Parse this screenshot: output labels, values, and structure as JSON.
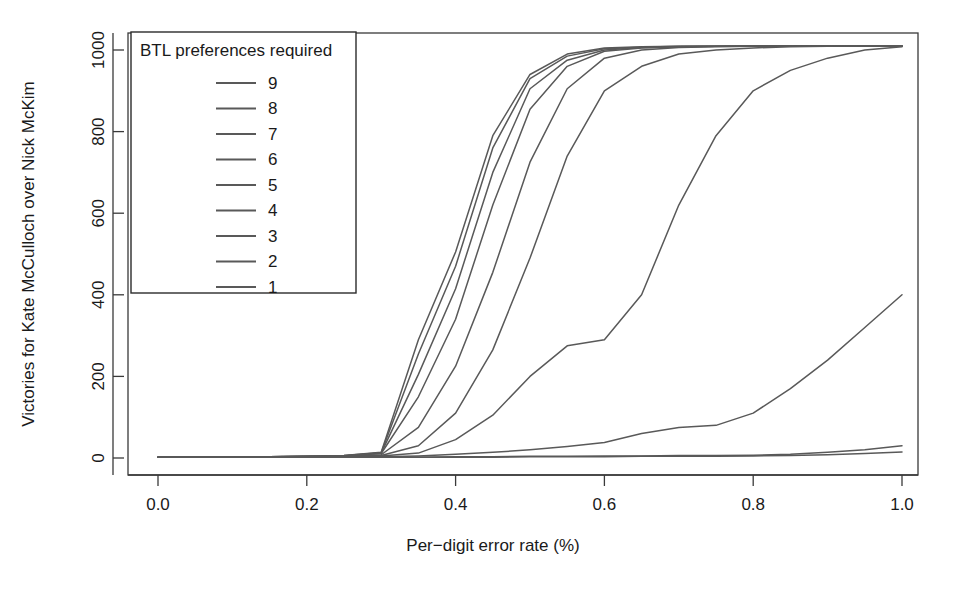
{
  "chart_data": {
    "type": "line",
    "title": "",
    "xlabel": "Per−digit error rate (%)",
    "ylabel": "Victories for Kate McCulloch over Nick McKim",
    "xlim": [
      0.0,
      1.0
    ],
    "ylim": [
      0,
      1010
    ],
    "xticks": [
      0.0,
      0.2,
      0.4,
      0.6,
      0.8,
      1.0
    ],
    "xticklabels": [
      "0.0",
      "0.2",
      "0.4",
      "0.6",
      "0.8",
      "1.0"
    ],
    "yticks": [
      0,
      200,
      400,
      600,
      800,
      1000
    ],
    "yticklabels": [
      "0",
      "200",
      "400",
      "600",
      "800",
      "1000"
    ],
    "grid": false,
    "legend_position": "top-left",
    "legend_title": "BTL preferences required",
    "line_color": "#595959",
    "x": [
      0.0,
      0.05,
      0.1,
      0.15,
      0.2,
      0.25,
      0.3,
      0.35,
      0.4,
      0.45,
      0.5,
      0.55,
      0.6,
      0.65,
      0.7,
      0.75,
      0.8,
      0.85,
      0.9,
      0.95,
      1.0
    ],
    "series": [
      {
        "name": "9",
        "label": "9",
        "values": [
          2,
          2,
          3,
          3,
          4,
          6,
          14,
          290,
          505,
          790,
          940,
          990,
          1005,
          1008,
          1009,
          1009,
          1010,
          1010,
          1010,
          1010,
          1010
        ]
      },
      {
        "name": "8",
        "label": "8",
        "values": [
          2,
          2,
          3,
          3,
          4,
          6,
          13,
          255,
          470,
          760,
          930,
          985,
          1003,
          1007,
          1009,
          1009,
          1010,
          1010,
          1010,
          1010,
          1010
        ]
      },
      {
        "name": "7",
        "label": "7",
        "values": [
          2,
          2,
          3,
          3,
          4,
          5,
          12,
          205,
          415,
          700,
          905,
          975,
          1000,
          1006,
          1008,
          1009,
          1010,
          1010,
          1010,
          1010,
          1010
        ]
      },
      {
        "name": "6",
        "label": "6",
        "values": [
          2,
          2,
          3,
          3,
          4,
          5,
          11,
          150,
          340,
          620,
          855,
          960,
          997,
          1005,
          1008,
          1009,
          1009,
          1010,
          1010,
          1010,
          1010
        ]
      },
      {
        "name": "5",
        "label": "5",
        "values": [
          2,
          2,
          2,
          3,
          3,
          4,
          8,
          75,
          225,
          455,
          725,
          905,
          980,
          1000,
          1006,
          1008,
          1009,
          1009,
          1010,
          1010,
          1010
        ]
      },
      {
        "name": "4",
        "label": "4",
        "values": [
          2,
          2,
          2,
          3,
          3,
          4,
          6,
          30,
          110,
          265,
          490,
          740,
          900,
          960,
          990,
          1000,
          1005,
          1008,
          1009,
          1010,
          1010
        ]
      },
      {
        "name": "3",
        "label": "3",
        "values": [
          2,
          2,
          2,
          2,
          3,
          3,
          5,
          12,
          45,
          105,
          200,
          275,
          290,
          400,
          620,
          790,
          900,
          950,
          980,
          1000,
          1008
        ]
      },
      {
        "name": "2",
        "label": "2",
        "values": [
          2,
          2,
          2,
          2,
          2,
          3,
          3,
          5,
          9,
          14,
          20,
          28,
          38,
          60,
          75,
          80,
          110,
          170,
          240,
          320,
          400
        ]
      },
      {
        "name": "1",
        "label": "1",
        "values": [
          2,
          2,
          2,
          2,
          2,
          2,
          2,
          2,
          3,
          3,
          4,
          4,
          5,
          5,
          6,
          6,
          7,
          9,
          14,
          20,
          30
        ]
      },
      {
        "name": "1b",
        "label": "",
        "values": [
          2,
          2,
          2,
          2,
          2,
          2,
          2,
          2,
          2,
          2,
          3,
          3,
          3,
          4,
          4,
          4,
          5,
          6,
          8,
          11,
          15
        ]
      }
    ],
    "legend_entries": [
      "9",
      "8",
      "7",
      "6",
      "5",
      "4",
      "3",
      "2",
      "1"
    ]
  }
}
